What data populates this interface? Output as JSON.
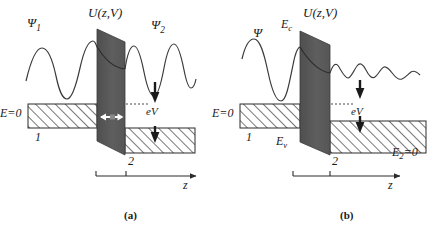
{
  "figure": {
    "colors": {
      "barrier_fill": "#5b5b5b",
      "hatch_line": "#2e2e2e",
      "stroke": "#2b2b2b",
      "background": "#ffffff",
      "arrow_white": "#ffffff"
    }
  },
  "panel_a": {
    "caption": "(a)",
    "potential_label": "U(z,V)",
    "wave_left_label": "Ψ",
    "wave_left_sub": "1",
    "wave_right_label": "Ψ",
    "wave_right_sub": "2",
    "energy_zero_label": "E=0",
    "bias_label": "eV",
    "electrode_left_number": "1",
    "electrode_right_number": "2",
    "axis_label": "z"
  },
  "panel_b": {
    "caption": "(b)",
    "potential_label": "U(z,V)",
    "wave_label": "Ψ",
    "conduction_band_label": "E",
    "conduction_band_sub": "c",
    "valence_band_label": "E",
    "valence_band_sub": "v",
    "energy_zero_label": "E=0",
    "energy_right_label": "E",
    "energy_right_sub": "2",
    "energy_right_suffix": "=0",
    "bias_label": "eV",
    "electrode_left_number": "1",
    "electrode_right_number": "2",
    "axis_label": "z"
  }
}
